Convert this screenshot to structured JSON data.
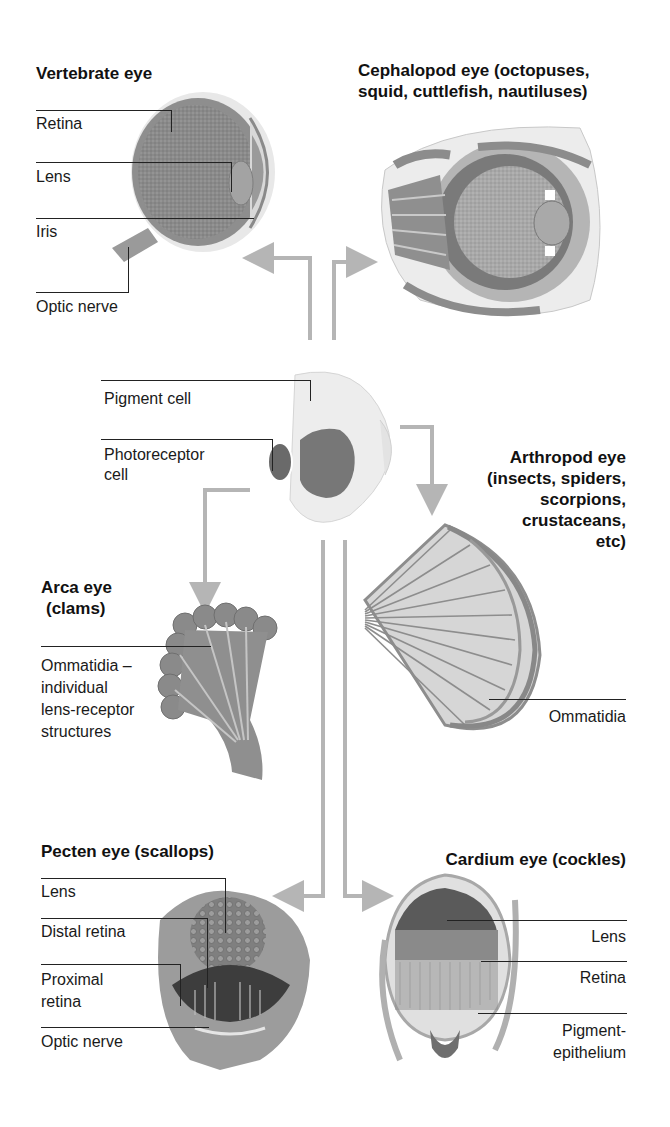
{
  "diagram": {
    "center": {
      "name": "Primitive eye",
      "labels": [
        "Pigment cell",
        "Photoreceptor cell"
      ]
    },
    "eyes": [
      {
        "id": "vertebrate",
        "title": "Vertebrate eye",
        "labels": [
          "Retina",
          "Lens",
          "Iris",
          "Optic nerve"
        ]
      },
      {
        "id": "cephalopod",
        "title": "Cephalopod eye (octopuses, squid, cuttlefish, nautiluses)",
        "labels": []
      },
      {
        "id": "arthropod",
        "title": "Arthropod eye (insects, spiders, scorpions, crustaceans, etc)",
        "labels": [
          "Ommatidia"
        ]
      },
      {
        "id": "arca",
        "title": "Arca eye (clams)",
        "labels": [
          "Ommatidia – individual lens-receptor structures"
        ]
      },
      {
        "id": "pecten",
        "title": "Pecten eye (scallops)",
        "labels": [
          "Lens",
          "Distal retina",
          "Proximal retina",
          "Optic nerve"
        ]
      },
      {
        "id": "cardium",
        "title": "Cardium eye (cockles)",
        "labels": [
          "Lens",
          "Retina",
          "Pigment-epithelium"
        ]
      }
    ],
    "arrow_color": "#b5b5b5",
    "tissue_colors": {
      "dark": "#6e6e6e",
      "mid": "#9a9a9a",
      "light": "#cfcfcf",
      "pale": "#ececec"
    }
  },
  "text": {
    "vertebrate_title": "Vertebrate eye",
    "vertebrate_retina": "Retina",
    "vertebrate_lens": "Lens",
    "vertebrate_iris": "Iris",
    "vertebrate_optic": "Optic nerve",
    "cephalopod_title_1": "Cephalopod eye (octopuses,",
    "cephalopod_title_2": "squid, cuttlefish, nautiluses)",
    "pigment_cell": "Pigment cell",
    "photoreceptor_1": "Photoreceptor",
    "photoreceptor_2": "cell",
    "arthropod_title_1": "Arthropod eye",
    "arthropod_title_2": "(insects, spiders,",
    "arthropod_title_3": "scorpions,",
    "arthropod_title_4": "crustaceans,",
    "arthropod_title_5": "etc)",
    "arthropod_ommatidia": "Ommatidia",
    "arca_title_1": "Arca eye",
    "arca_title_2": "(clams)",
    "arca_label_1": "Ommatidia –",
    "arca_label_2": "individual",
    "arca_label_3": "lens-receptor",
    "arca_label_4": "structures",
    "pecten_title": "Pecten eye (scallops)",
    "pecten_lens": "Lens",
    "pecten_distal": "Distal retina",
    "pecten_proximal_1": "Proximal",
    "pecten_proximal_2": "retina",
    "pecten_optic": "Optic nerve",
    "cardium_title": "Cardium eye (cockles)",
    "cardium_lens": "Lens",
    "cardium_retina": "Retina",
    "cardium_pigment_1": "Pigment-",
    "cardium_pigment_2": "epithelium"
  }
}
